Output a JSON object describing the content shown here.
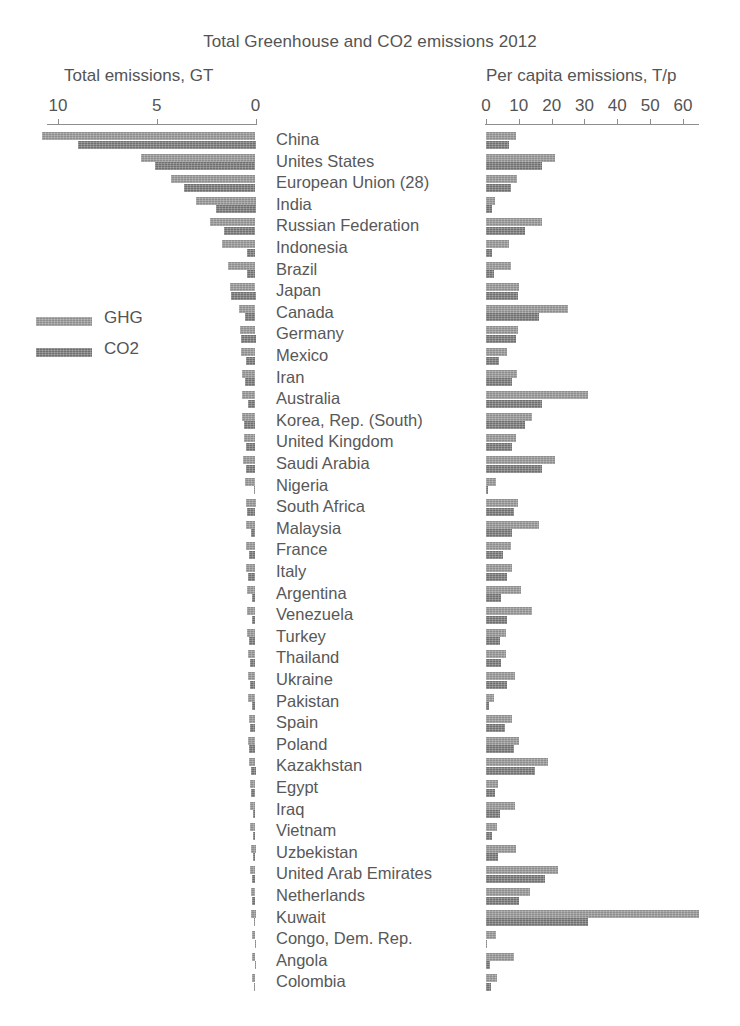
{
  "chart_data": {
    "type": "bar",
    "title": "Total Greenhouse and CO2 emissions 2012",
    "orientation": "horizontal",
    "panels": [
      {
        "id": "total",
        "axis_title": "Total emissions, GT",
        "xlabel": "Total emissions, GT",
        "ticks": [
          10,
          5,
          0
        ],
        "tick_labels": [
          "10",
          "5",
          "0"
        ],
        "xlim": [
          10,
          0
        ],
        "direction": "right-to-left",
        "grid": false
      },
      {
        "id": "per_capita",
        "axis_title": "Per capita emissions, T/p",
        "xlabel": "Per capita emissions, T/p",
        "ticks": [
          0,
          10,
          20,
          30,
          40,
          50,
          60
        ],
        "tick_labels": [
          "0",
          "10",
          "20",
          "30",
          "40",
          "50",
          "60"
        ],
        "xlim": [
          0,
          65
        ],
        "direction": "left-to-right",
        "grid": false
      }
    ],
    "legend": {
      "position": "left-middle",
      "entries": [
        {
          "name": "GHG",
          "color": "#8d8d8d"
        },
        {
          "name": "CO2",
          "color": "#6f6f6f"
        }
      ]
    },
    "series": [
      {
        "name": "GHG",
        "color": "#8d8d8d"
      },
      {
        "name": "CO2",
        "color": "#6f6f6f"
      }
    ],
    "categories": [
      "China",
      "Unites States",
      "European Union (28)",
      "India",
      "Russian Federation",
      "Indonesia",
      "Brazil",
      "Japan",
      "Canada",
      "Germany",
      "Mexico",
      "Iran",
      "Australia",
      "Korea, Rep. (South)",
      "United Kingdom",
      "Saudi Arabia",
      "Nigeria",
      "South Africa",
      "Malaysia",
      "France",
      "Italy",
      "Argentina",
      "Venezuela",
      "Turkey",
      "Thailand",
      "Ukraine",
      "Pakistan",
      "Spain",
      "Poland",
      "Kazakhstan",
      "Egypt",
      "Iraq",
      "Vietnam",
      "Uzbekistan",
      "United Arab Emirates",
      "Netherlands",
      "Kuwait",
      "Congo, Dem. Rep.",
      "Angola",
      "Colombia"
    ],
    "total_emissions_GT": {
      "GHG": [
        10.8,
        5.8,
        4.3,
        3.0,
        2.3,
        1.7,
        1.4,
        1.3,
        0.85,
        0.78,
        0.72,
        0.7,
        0.7,
        0.68,
        0.57,
        0.62,
        0.51,
        0.5,
        0.46,
        0.48,
        0.46,
        0.44,
        0.42,
        0.43,
        0.4,
        0.39,
        0.37,
        0.35,
        0.38,
        0.31,
        0.29,
        0.28,
        0.27,
        0.25,
        0.26,
        0.22,
        0.25,
        0.2,
        0.17,
        0.16
      ],
      "CO2": [
        9.0,
        5.1,
        3.6,
        2.0,
        1.6,
        0.45,
        0.45,
        1.25,
        0.55,
        0.75,
        0.47,
        0.55,
        0.39,
        0.59,
        0.48,
        0.46,
        0.09,
        0.44,
        0.22,
        0.34,
        0.38,
        0.19,
        0.2,
        0.32,
        0.3,
        0.3,
        0.17,
        0.27,
        0.32,
        0.25,
        0.21,
        0.14,
        0.15,
        0.11,
        0.17,
        0.17,
        0.09,
        0.03,
        0.03,
        0.07
      ]
    },
    "per_capita_emissions_Tp": {
      "GHG": [
        9.0,
        21.0,
        9.5,
        2.6,
        17.0,
        7.0,
        7.5,
        10.0,
        25.0,
        9.8,
        6.5,
        9.5,
        31.0,
        14.0,
        9.2,
        21.0,
        3.0,
        9.8,
        16.0,
        7.5,
        7.8,
        10.8,
        14.0,
        6.0,
        6.0,
        8.8,
        2.3,
        7.8,
        10.0,
        19.0,
        3.8,
        8.8,
        3.2,
        9.0,
        22.0,
        13.5,
        65.0,
        3.0,
        8.5,
        3.5
      ],
      "CO2": [
        7.0,
        17.0,
        7.5,
        1.7,
        12.0,
        1.9,
        2.3,
        9.8,
        16.0,
        9.2,
        4.0,
        7.8,
        17.0,
        12.0,
        7.8,
        17.0,
        0.6,
        8.5,
        7.8,
        5.2,
        6.3,
        4.7,
        6.5,
        4.3,
        4.5,
        6.5,
        0.9,
        5.8,
        8.5,
        15.0,
        2.6,
        4.2,
        1.7,
        3.8,
        18.0,
        10.0,
        31.0,
        0.04,
        1.3,
        1.5
      ]
    }
  }
}
